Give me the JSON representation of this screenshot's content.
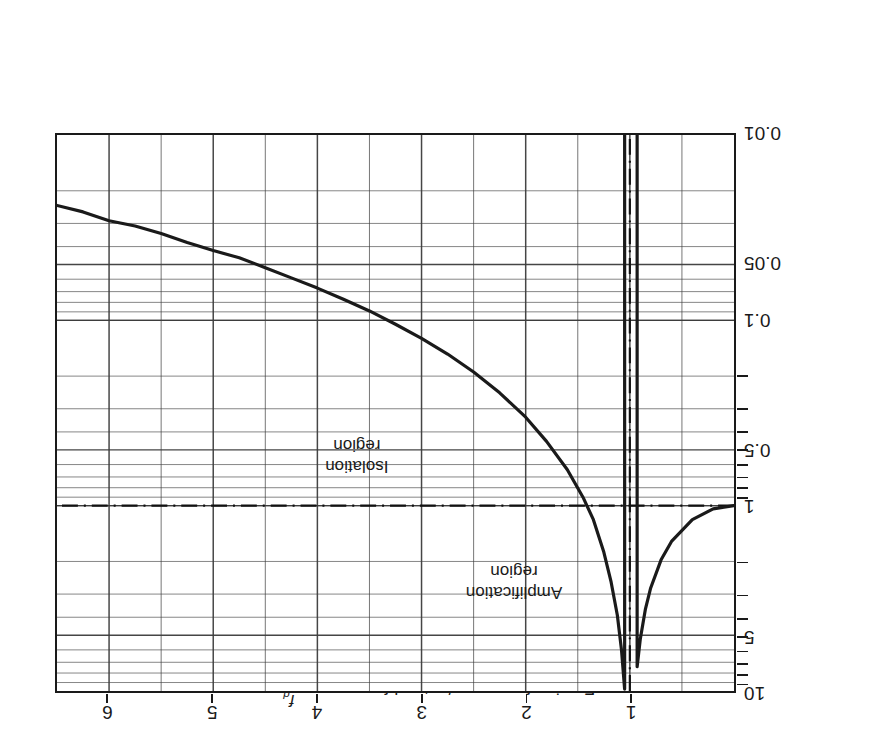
{
  "figure": {
    "orientation_note": "rotated-180",
    "background_color": "#ffffff",
    "line_color": "#1a1a1a",
    "grid_color": "#555555"
  },
  "axes": {
    "x": {
      "title_text": "Forcing frequency/natural frequency,",
      "title_fraction_numerator": "f",
      "title_fraction_numerator_sub": "d",
      "title_fraction_denominator": "f",
      "title_fraction_denominator_sub": "n",
      "ticks": [
        "1",
        "2",
        "3",
        "4",
        "5",
        "6"
      ],
      "tick_values": [
        1,
        2,
        3,
        4,
        5,
        6
      ],
      "min": 0,
      "max": 6.5
    },
    "y": {
      "title_text": "Transmissibility, ",
      "title_symbol_1": "T",
      "title_symbol_1_sub": "F",
      "title_separator": ", ",
      "title_symbol_2": "T",
      "title_symbol_2_sub": "D",
      "ticks": [
        "10",
        "5",
        "1",
        "0.5",
        "0.1",
        "0.05",
        "0.01"
      ],
      "tick_values": [
        10,
        5,
        1,
        0.5,
        0.1,
        0.05,
        0.01
      ],
      "scale": "log",
      "min": 0.01,
      "max": 10
    }
  },
  "annotations": [
    {
      "name": "amplification-region",
      "line1": "Amplification",
      "line2": "region",
      "x": 2.1,
      "y": 2.6
    },
    {
      "name": "isolation-region",
      "line1": "Isolation",
      "line2": "region",
      "x": 3.6,
      "y": 0.55
    }
  ],
  "reference_line": {
    "label": "T = 1",
    "y_value": 1
  },
  "resonance_line": {
    "label": "fd/fn = 1",
    "x_value": 1
  },
  "chart_data": {
    "type": "line",
    "title": "",
    "xlabel": "Forcing frequency/natural frequency, fd/fn",
    "ylabel": "Transmissibility, TF, TD",
    "xlim": [
      0,
      6.5
    ],
    "ylim": [
      0.01,
      10
    ],
    "yscale": "log",
    "grid": true,
    "legend": "none",
    "annotations": [
      "Amplification region",
      "Isolation region"
    ],
    "series": [
      {
        "name": "Transmissibility (undamped)",
        "x": [
          0.0,
          0.2,
          0.4,
          0.6,
          0.7,
          0.8,
          0.85,
          0.9,
          0.93,
          0.95,
          0.97,
          0.985,
          0.995,
          1.005,
          1.015,
          1.03,
          1.05,
          1.08,
          1.12,
          1.18,
          1.25,
          1.35,
          1.45,
          1.6,
          1.8,
          2.0,
          2.25,
          2.5,
          2.75,
          3.0,
          3.25,
          3.5,
          3.75,
          4.0,
          4.25,
          4.5,
          4.75,
          5.0,
          5.25,
          5.5,
          5.75,
          6.0,
          6.25,
          6.5
        ],
        "y": [
          1.0,
          1.04,
          1.19,
          1.56,
          1.96,
          2.78,
          3.6,
          5.26,
          7.4,
          10.0,
          10.0,
          10.0,
          10.0,
          10.0,
          10.0,
          10.0,
          9.76,
          6.02,
          3.9,
          2.58,
          1.78,
          1.19,
          0.9,
          0.64,
          0.45,
          0.333,
          0.246,
          0.19,
          0.152,
          0.125,
          0.105,
          0.089,
          0.077,
          0.067,
          0.059,
          0.052,
          0.046,
          0.042,
          0.038,
          0.034,
          0.031,
          0.029,
          0.026,
          0.024
        ],
        "color": "#1a1a1a",
        "width": 3.2
      }
    ],
    "reference_lines": [
      {
        "orientation": "horizontal",
        "value": 1,
        "style": "dash-dot"
      },
      {
        "orientation": "vertical",
        "value": 1,
        "style": "dash-dot"
      }
    ],
    "xticks": [
      1,
      2,
      3,
      4,
      5,
      6
    ],
    "yticks": [
      0.01,
      0.05,
      0.1,
      0.5,
      1,
      5,
      10
    ],
    "ytick_labels": [
      "0.01",
      "0.05",
      "0.1",
      "0.5",
      "1",
      "5",
      "10"
    ],
    "xtick_labels": [
      "1",
      "2",
      "3",
      "4",
      "5",
      "6"
    ]
  }
}
